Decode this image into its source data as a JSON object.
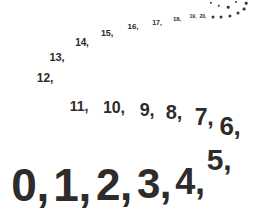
{
  "figure": {
    "kind": "number-sequence-spiral",
    "background_color": "#ffffff",
    "text_color": "#2e2c2b"
  },
  "items": [
    {
      "label": "0,",
      "x": 30,
      "y": 185,
      "size": 46
    },
    {
      "label": "1,",
      "x": 72,
      "y": 185,
      "size": 46
    },
    {
      "label": "2,",
      "x": 114,
      "y": 185,
      "size": 44
    },
    {
      "label": "3,",
      "x": 154,
      "y": 184,
      "size": 42
    },
    {
      "label": "4,",
      "x": 190,
      "y": 182,
      "size": 36
    },
    {
      "label": "5,",
      "x": 219,
      "y": 160,
      "size": 30
    },
    {
      "label": "6,",
      "x": 230,
      "y": 126,
      "size": 26
    },
    {
      "label": "7,",
      "x": 204,
      "y": 117,
      "size": 23
    },
    {
      "label": "8,",
      "x": 174,
      "y": 112,
      "size": 20
    },
    {
      "label": "9,",
      "x": 147,
      "y": 110,
      "size": 18
    },
    {
      "label": "10,",
      "x": 114,
      "y": 108,
      "size": 16
    },
    {
      "label": "11,",
      "x": 79,
      "y": 106,
      "size": 14
    },
    {
      "label": "12,",
      "x": 45,
      "y": 78,
      "size": 12
    },
    {
      "label": "13,",
      "x": 57,
      "y": 57,
      "size": 11
    },
    {
      "label": "14,",
      "x": 82,
      "y": 43,
      "size": 10
    },
    {
      "label": "15,",
      "x": 107,
      "y": 33,
      "size": 9
    },
    {
      "label": "16,",
      "x": 133,
      "y": 27,
      "size": 8
    },
    {
      "label": "17,",
      "x": 157,
      "y": 22,
      "size": 7
    },
    {
      "label": "18,",
      "x": 177,
      "y": 19,
      "size": 6
    },
    {
      "label": "19,",
      "x": 193,
      "y": 16,
      "size": 5
    },
    {
      "label": "20,",
      "x": 203,
      "y": 16,
      "size": 5
    }
  ],
  "dots": [
    {
      "x": 213,
      "y": 17,
      "d": 3.0
    },
    {
      "x": 221,
      "y": 17,
      "d": 3.0
    },
    {
      "x": 230,
      "y": 16,
      "d": 3.2
    },
    {
      "x": 238,
      "y": 13,
      "d": 3.0
    },
    {
      "x": 244,
      "y": 9,
      "d": 2.8
    },
    {
      "x": 246,
      "y": 3,
      "d": 2.6
    },
    {
      "x": 228,
      "y": 7,
      "d": 2.6
    },
    {
      "x": 219,
      "y": 6,
      "d": 2.4
    },
    {
      "x": 211,
      "y": 3,
      "d": 2.4
    },
    {
      "x": 236,
      "y": 2,
      "d": 2.2
    }
  ]
}
